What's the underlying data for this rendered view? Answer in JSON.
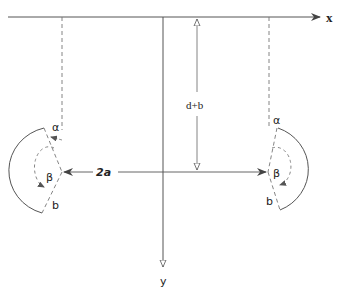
{
  "diagram": {
    "axes": {
      "x_label": "x",
      "y_label": "y"
    },
    "dimensions": {
      "vertical_label": "d+b",
      "horizontal_label": "2a"
    },
    "left_body": {
      "angle_top_label": "α",
      "angle_mid_label": "β",
      "end_label": "b"
    },
    "right_body": {
      "angle_top_label": "α",
      "angle_mid_label": "β",
      "end_label": "b"
    },
    "colors": {
      "line": "#555555",
      "dashed": "#777777",
      "text": "#222222"
    }
  }
}
